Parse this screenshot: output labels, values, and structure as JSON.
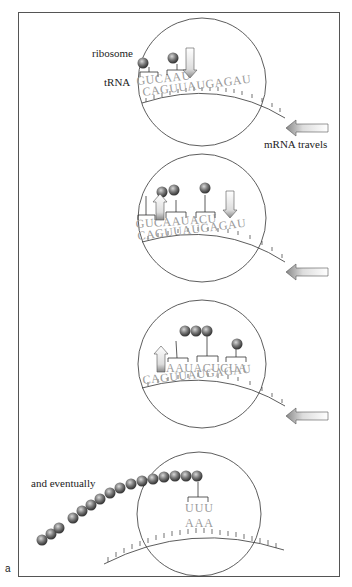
{
  "figure": {
    "letter": "a",
    "colors": {
      "amino_acid": "#7a7a7a",
      "letters": "#9a9a9a",
      "line": "#333333",
      "arrow_fill": "#f5f5f5",
      "arrow_shade": "#b0b0b0"
    },
    "panels": [
      {
        "id": 1,
        "labels": {
          "ribosome": "ribosome",
          "trna": "tRNA",
          "mrna_travels": "mRNA travels"
        },
        "trna_seq": "GUCAAU",
        "mrna_seq": "CAGUUAUGAGAU"
      },
      {
        "id": 2,
        "trna_seq": "GUCAAUACU",
        "mrna_seq": "CAGUUAUGAGAU"
      },
      {
        "id": 3,
        "trna_seq": "AAUACUCUA",
        "mrna_seq": "CAGUUAUGAGAU"
      },
      {
        "id": 4,
        "labels": {
          "eventually": "and eventually"
        },
        "trna_seq": "UUU",
        "mrna_seq": "AAA"
      }
    ]
  }
}
